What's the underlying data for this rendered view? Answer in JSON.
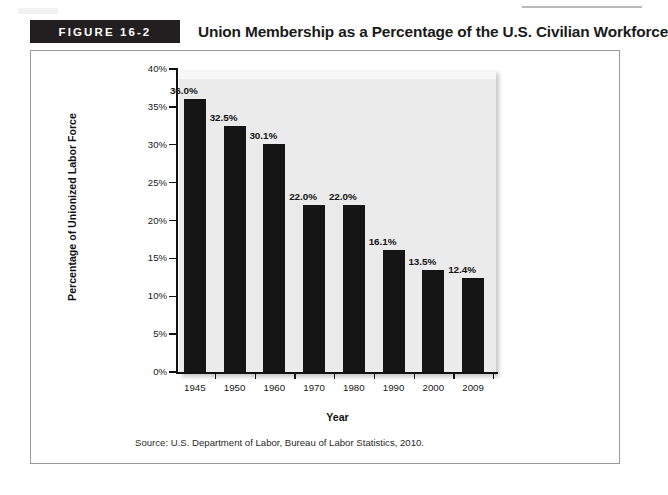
{
  "figure": {
    "badge_label": "FIGURE 16-2",
    "title": "Union Membership as a Percentage of the U.S. Civilian Workforce",
    "source_note": "Source: U.S. Department of Labor, Bureau of Labor Statistics, 2010."
  },
  "colors": {
    "bar": "#151515",
    "badge_background": "#231f20",
    "plot_background": "#ebebeb",
    "frame_border": "#9a9a9a",
    "axis": "#111111"
  },
  "chart_data": {
    "type": "bar",
    "title": "Union Membership as a Percentage of the U.S. Civilian Workforce",
    "xlabel": "Year",
    "ylabel": "Percentage of Unionized Labor Force",
    "categories": [
      "1945",
      "1950",
      "1960",
      "1970",
      "1980",
      "1990",
      "2000",
      "2009"
    ],
    "values": [
      36.0,
      32.5,
      30.1,
      22.0,
      22.0,
      16.1,
      13.5,
      12.4
    ],
    "data_labels": [
      "36.0%",
      "32.5%",
      "30.1%",
      "22.0%",
      "22.0%",
      "16.1%",
      "13.5%",
      "12.4%"
    ],
    "ylim": [
      0,
      40
    ],
    "ytick_values": [
      0,
      5,
      10,
      15,
      20,
      25,
      30,
      35,
      40
    ],
    "ytick_labels": [
      "0%",
      "5%",
      "10%",
      "15%",
      "20%",
      "25%",
      "30%",
      "35%",
      "40%"
    ],
    "grid": false,
    "legend": false
  }
}
